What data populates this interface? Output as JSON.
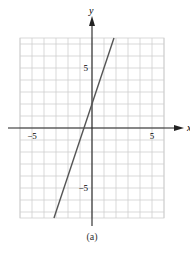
{
  "chart_data": {
    "type": "line",
    "title": "",
    "caption": "(a)",
    "xlabel": "x",
    "ylabel": "y",
    "xlim": [
      -6,
      6
    ],
    "ylim": [
      -7.5,
      7.5
    ],
    "grid": true,
    "x_tick_labels": [
      {
        "value": -5,
        "label": "−5"
      },
      {
        "value": 5,
        "label": "5"
      }
    ],
    "y_tick_labels": [
      {
        "value": 5,
        "label": "5"
      },
      {
        "value": -5,
        "label": "−5"
      }
    ],
    "series": [
      {
        "name": "line",
        "equation": "y = 3x + 2",
        "x": [
          -3.17,
          1.83
        ],
        "y": [
          -7.5,
          7.5
        ]
      }
    ]
  },
  "colors": {
    "grid": "#cfcfcf",
    "axis": "#222222",
    "line": "#555555"
  }
}
